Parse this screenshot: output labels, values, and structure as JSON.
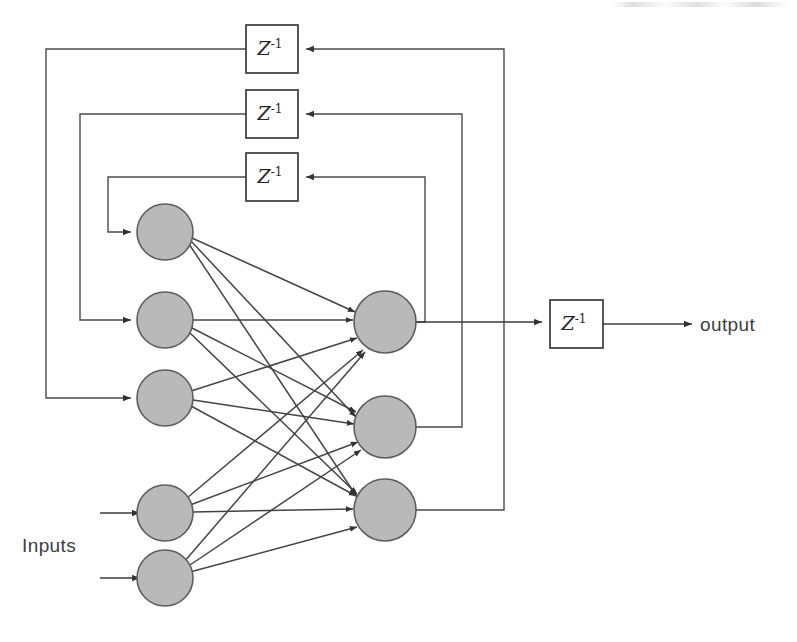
{
  "figure": {
    "type": "diagram",
    "background_color": "#ffffff",
    "neuron_fill_color": "#b9b9b9",
    "neuron_stroke_color": "#5e5e5e",
    "wire_color": "#3a3a3a"
  },
  "labels": {
    "inputs": "Inputs",
    "output": "output",
    "delay": "Z",
    "delay_exponent": "-1"
  },
  "delay_blocks": [
    {
      "id": "delay-feedback-1",
      "label": "Z",
      "exponent": "-1",
      "x": 246,
      "y": 25,
      "w": 52,
      "h": 48
    },
    {
      "id": "delay-feedback-2",
      "label": "Z",
      "exponent": "-1",
      "x": 246,
      "y": 90,
      "w": 52,
      "h": 48
    },
    {
      "id": "delay-feedback-3",
      "label": "Z",
      "exponent": "-1",
      "x": 246,
      "y": 153,
      "w": 52,
      "h": 48
    },
    {
      "id": "delay-output",
      "label": "Z",
      "exponent": "-1",
      "x": 550,
      "y": 300,
      "w": 53,
      "h": 48
    }
  ],
  "input_layer": {
    "count": 5,
    "radius": 28,
    "neurons": [
      {
        "id": "input-neuron-1",
        "cx": 165,
        "cy": 232,
        "source": "feedback-delay-3"
      },
      {
        "id": "input-neuron-2",
        "cx": 165,
        "cy": 320,
        "source": "feedback-delay-2"
      },
      {
        "id": "input-neuron-3",
        "cx": 165,
        "cy": 398,
        "source": "feedback-delay-1"
      },
      {
        "id": "input-neuron-4",
        "cx": 165,
        "cy": 513,
        "source": "external-input"
      },
      {
        "id": "input-neuron-5",
        "cx": 165,
        "cy": 578,
        "source": "external-input"
      }
    ]
  },
  "hidden_layer": {
    "count": 3,
    "radius": 31,
    "neurons": [
      {
        "id": "hidden-neuron-1",
        "cx": 385,
        "cy": 322,
        "feeds": "output-delay"
      },
      {
        "id": "hidden-neuron-2",
        "cx": 385,
        "cy": 427,
        "feeds": "feedback-delay-2"
      },
      {
        "id": "hidden-neuron-3",
        "cx": 385,
        "cy": 510,
        "feeds": "feedback-delay-1"
      }
    ]
  },
  "connections": {
    "fully_connected": true,
    "from_layer": "input_layer",
    "to_layer": "hidden_layer",
    "edge_count": 15
  },
  "feedback_paths": [
    {
      "id": "feedback-path-1",
      "from": "hidden-neuron-3",
      "via": "delay-feedback-1",
      "to": "input-neuron-3",
      "right_x": 504,
      "left_x": 46
    },
    {
      "id": "feedback-path-2",
      "from": "hidden-neuron-2",
      "via": "delay-feedback-2",
      "to": "input-neuron-2",
      "right_x": 462,
      "left_x": 80
    },
    {
      "id": "feedback-path-3",
      "from": "hidden-neuron-1",
      "via": "delay-feedback-3",
      "to": "input-neuron-1",
      "right_x": 425,
      "left_x": 108
    }
  ],
  "external_inputs": [
    {
      "id": "external-input-1",
      "to": "input-neuron-4",
      "start_x": 100,
      "y": 513
    },
    {
      "id": "external-input-2",
      "to": "input-neuron-5",
      "start_x": 100,
      "y": 578
    }
  ],
  "output_path": {
    "from": "hidden-neuron-1",
    "via": "delay-output",
    "arrow_tip_x": 692,
    "label_x": 700,
    "y": 324
  }
}
